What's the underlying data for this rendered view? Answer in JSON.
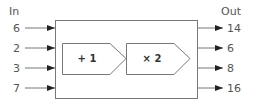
{
  "headers": {
    "in": "In",
    "out": "Out"
  },
  "inputs": [
    "6",
    "2",
    "3",
    "7"
  ],
  "outputs": [
    "14",
    "6",
    "8",
    "16"
  ],
  "operations": [
    {
      "label": "+ 1"
    },
    {
      "label": "× 2"
    }
  ],
  "colors": {
    "stroke": "#777777",
    "arrow": "#222222",
    "text": "#555555"
  }
}
